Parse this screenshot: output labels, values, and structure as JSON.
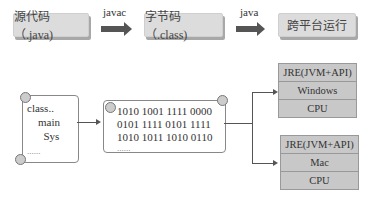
{
  "top_flow": {
    "boxes": [
      {
        "label": "源代码（.java)"
      },
      {
        "label": "字节码（.class)"
      },
      {
        "label": "跨平台运行"
      }
    ],
    "arrows": [
      {
        "label": "javac"
      },
      {
        "label": "java"
      }
    ]
  },
  "source_scroll": {
    "lines": [
      "class..",
      "    main",
      "      Sys",
      "......"
    ]
  },
  "bytecode_scroll": {
    "lines": [
      "1010 1001 1111 0000",
      "0101 1111 0101 1111",
      "1010 1011 1010 0110",
      "......"
    ]
  },
  "platforms": [
    {
      "rows": [
        "JRE(JVM+API)",
        "Windows",
        "CPU"
      ]
    },
    {
      "rows": [
        "JRE(JVM+API)",
        "Mac",
        "CPU"
      ]
    }
  ]
}
